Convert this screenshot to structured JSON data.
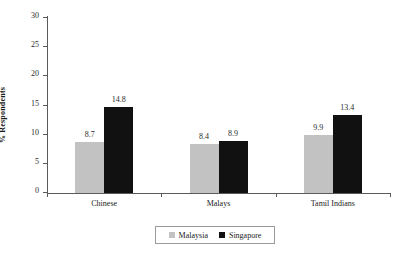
{
  "chart_data": {
    "type": "bar",
    "title": "",
    "subtitle": "",
    "xlabel": "",
    "ylabel": "% Respondents",
    "categories": [
      "Chinese",
      "Malays",
      "Tamil Indians"
    ],
    "series": [
      {
        "name": "Malaysia",
        "color": "#c2c2c2",
        "values": [
          8.7,
          8.4,
          9.9
        ]
      },
      {
        "name": "Singapore",
        "color": "#111111",
        "values": [
          14.8,
          8.9,
          13.4
        ]
      }
    ],
    "value_labels": [
      [
        "8.7",
        "14.8"
      ],
      [
        "8.4",
        "8.9"
      ],
      [
        "9.9",
        "13.4"
      ]
    ],
    "ylim": [
      0,
      30
    ],
    "yticks": [
      0,
      5,
      10,
      15,
      20,
      25,
      30
    ],
    "ytick_labels": [
      "0",
      "5",
      "10",
      "15",
      "20",
      "25",
      "30"
    ],
    "grid": false,
    "legend_position": "bottom-center",
    "legend_entries": [
      "Malaysia",
      "Singapore"
    ]
  },
  "axes": {
    "y_title": "% Respondents"
  }
}
